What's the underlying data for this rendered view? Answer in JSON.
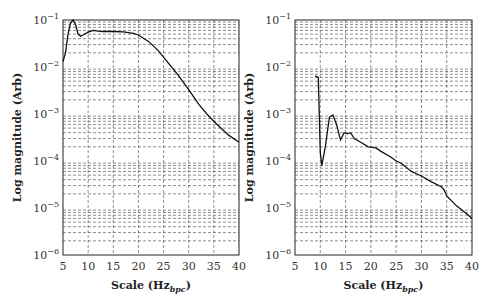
{
  "chart_data": [
    {
      "type": "line",
      "title": "",
      "xlabel": "Scale (Hz_bpc)",
      "xlabel_main": "Scale (Hz",
      "xlabel_sub": "bpc",
      "xlabel_close": ")",
      "ylabel": "Log magnitude (Arb)",
      "xlim": [
        5,
        40
      ],
      "ylim": [
        1e-06,
        0.1
      ],
      "yscale": "log",
      "grid": true,
      "x_ticks": [
        5,
        10,
        15,
        20,
        25,
        30,
        35,
        40
      ],
      "y_ticks": [
        "10^-6",
        "10^-5",
        "10^-4",
        "10^-3",
        "10^-2",
        "10^-1"
      ],
      "series": [
        {
          "name": "left",
          "x": [
            5,
            5.5,
            6,
            6.5,
            7,
            7.5,
            8,
            8.5,
            9,
            10,
            11,
            12,
            13,
            15,
            17,
            19,
            20,
            22,
            24,
            26,
            28,
            30,
            32,
            34,
            36,
            38,
            40
          ],
          "y": [
            0.013,
            0.02,
            0.05,
            0.085,
            0.1,
            0.08,
            0.05,
            0.045,
            0.048,
            0.055,
            0.06,
            0.058,
            0.057,
            0.057,
            0.056,
            0.052,
            0.048,
            0.035,
            0.022,
            0.012,
            0.0065,
            0.0033,
            0.0016,
            0.0009,
            0.00055,
            0.00035,
            0.00025
          ]
        },
        {
          "name": "right",
          "x": [
            9,
            9.6,
            10,
            10.3,
            11,
            11.8,
            12.5,
            13.2,
            14,
            14.7,
            15.3,
            16,
            16.7,
            18,
            19.5,
            21,
            22,
            24,
            25,
            26,
            28,
            30,
            32,
            34,
            34.5,
            35,
            37,
            39,
            40
          ],
          "y": [
            0.0065,
            0.006,
            0.00015,
            8e-05,
            0.0002,
            0.00085,
            0.00095,
            0.0006,
            0.00028,
            0.0004,
            0.00038,
            0.0004,
            0.0003,
            0.00025,
            0.0002,
            0.00019,
            0.00016,
            0.00012,
            0.0001,
            9e-05,
            6e-05,
            4.8e-05,
            3.6e-05,
            2.8e-05,
            2.4e-05,
            1.8e-05,
            1.1e-05,
            7.5e-06,
            6e-06
          ]
        }
      ]
    }
  ]
}
